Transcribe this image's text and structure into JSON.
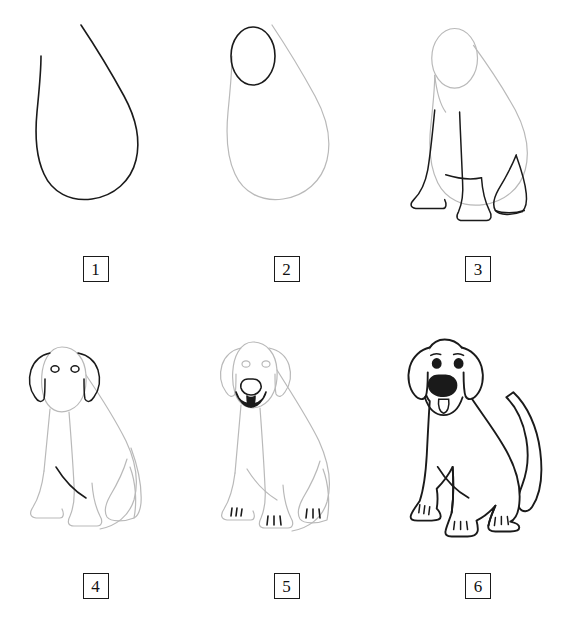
{
  "page": {
    "background_color": "#ffffff",
    "width": 574,
    "height": 634
  },
  "style": {
    "ink_color": "#1a1a1a",
    "guide_color": "#b9b9b9",
    "fill_color": "#ffffff",
    "badge_border_color": "#1a1a1a",
    "stroke_width_ink": 1.6,
    "stroke_width_guide": 1.2
  },
  "steps": [
    {
      "number": "1",
      "label": "Step 1",
      "description": "Draw a large teardrop shape for the dog's body.",
      "new_parts": [
        "body-teardrop"
      ],
      "guide_parts": []
    },
    {
      "number": "2",
      "label": "Step 2",
      "description": "Add an oval on the upper left for the head.",
      "new_parts": [
        "head-oval"
      ],
      "guide_parts": [
        "body-teardrop"
      ]
    },
    {
      "number": "3",
      "label": "Step 3",
      "description": "Draw the front legs, the hind leg and the paws.",
      "new_parts": [
        "front-leg-left",
        "front-leg-right",
        "hind-leg",
        "paws"
      ],
      "guide_parts": [
        "body-teardrop",
        "head-oval",
        "neck"
      ]
    },
    {
      "number": "4",
      "label": "Step 4",
      "description": "Add the two floppy ears and the eyes.",
      "new_parts": [
        "ear-left",
        "ear-right",
        "eye-left",
        "eye-right"
      ],
      "guide_parts": [
        "body-teardrop",
        "head-oval",
        "legs",
        "paws"
      ]
    },
    {
      "number": "5",
      "label": "Step 5",
      "description": "Draw the nose, the mouth with tongue and the toe lines.",
      "new_parts": [
        "nose",
        "mouth",
        "tongue",
        "toe-lines"
      ],
      "guide_parts": [
        "body",
        "head",
        "ears",
        "eyes",
        "legs",
        "paws"
      ]
    },
    {
      "number": "6",
      "label": "Step 6",
      "description": "Add the tail and ink all the final outlines. The dog is finished.",
      "new_parts": [
        "tail",
        "final-outline",
        "filled-eyes",
        "filled-nose"
      ],
      "guide_parts": []
    }
  ]
}
